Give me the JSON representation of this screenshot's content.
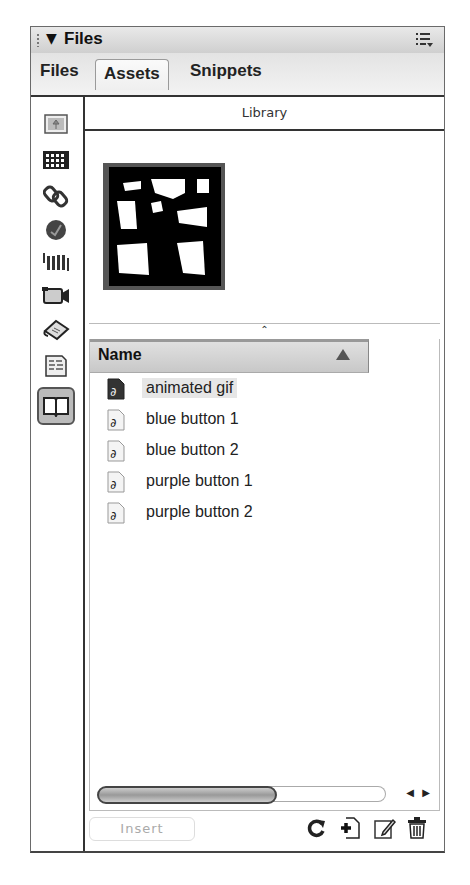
{
  "panel": {
    "title": "Files",
    "collapse_glyph": "▼",
    "options_icon": "panel-options-menu-icon"
  },
  "tabs": [
    {
      "label": "Files",
      "active": false
    },
    {
      "label": "Assets",
      "active": true
    },
    {
      "label": "Snippets",
      "active": false
    }
  ],
  "sidebar": {
    "items": [
      {
        "name": "images",
        "icon": "image-icon",
        "active": false
      },
      {
        "name": "colors",
        "icon": "color-grid-icon",
        "active": false
      },
      {
        "name": "urls",
        "icon": "chain-link-icon",
        "active": false
      },
      {
        "name": "flash",
        "icon": "flash-icon",
        "active": false
      },
      {
        "name": "shockwave",
        "icon": "shockwave-icon",
        "active": false
      },
      {
        "name": "movies",
        "icon": "movie-camera-icon",
        "active": false
      },
      {
        "name": "scripts",
        "icon": "script-scroll-icon",
        "active": false
      },
      {
        "name": "templates",
        "icon": "template-icon",
        "active": false
      },
      {
        "name": "library",
        "icon": "library-book-icon",
        "active": true
      }
    ]
  },
  "library": {
    "header": "Library",
    "splitter_glyph": "⌃",
    "column_name": "Name",
    "items": [
      {
        "name": "animated gif",
        "selected": true
      },
      {
        "name": "blue button 1",
        "selected": false
      },
      {
        "name": "blue button 2",
        "selected": false
      },
      {
        "name": "purple button 1",
        "selected": false
      },
      {
        "name": "purple button 2",
        "selected": false
      }
    ]
  },
  "scrollbar": {
    "left_arrow": "◀",
    "right_arrow": "▶"
  },
  "bottombar": {
    "insert_label": "Insert",
    "tools": [
      "refresh-site-list-icon",
      "new-library-item-icon",
      "edit-icon",
      "delete-icon"
    ]
  }
}
